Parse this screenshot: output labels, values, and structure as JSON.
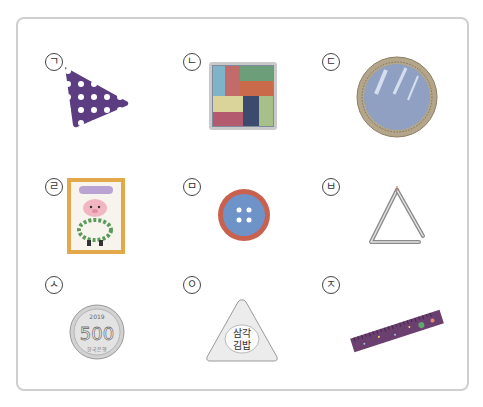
{
  "items": [
    {
      "label": "ㄱ",
      "object": "triangle-scarf",
      "shape": "triangle",
      "color": "#6b4a8e"
    },
    {
      "label": "ㄴ",
      "object": "square-patchwork-coaster",
      "shape": "square",
      "color": "#8a6f6b"
    },
    {
      "label": "ㄷ",
      "object": "round-mirror",
      "shape": "circle",
      "color": "#9aa3b5"
    },
    {
      "label": "ㄹ",
      "object": "picture-book",
      "shape": "rectangle",
      "color": "#d8a24a",
      "text": "~~~"
    },
    {
      "label": "ㅁ",
      "object": "button",
      "shape": "circle",
      "color": "#5b7fb3"
    },
    {
      "label": "ㅂ",
      "object": "triangle-instrument",
      "shape": "triangle",
      "color": "#999999"
    },
    {
      "label": "ㅅ",
      "object": "500-won-coin",
      "shape": "circle",
      "color": "#c8c8c8",
      "text": "500",
      "year": "2019",
      "bottom_text": "한국은행"
    },
    {
      "label": "ㅇ",
      "object": "triangle-kimbap",
      "shape": "triangle",
      "color": "#e5e5e5",
      "text_line1": "삼각",
      "text_line2": "김밥"
    },
    {
      "label": "ㅈ",
      "object": "ruler",
      "shape": "rectangle",
      "color": "#6a3b6b"
    }
  ]
}
